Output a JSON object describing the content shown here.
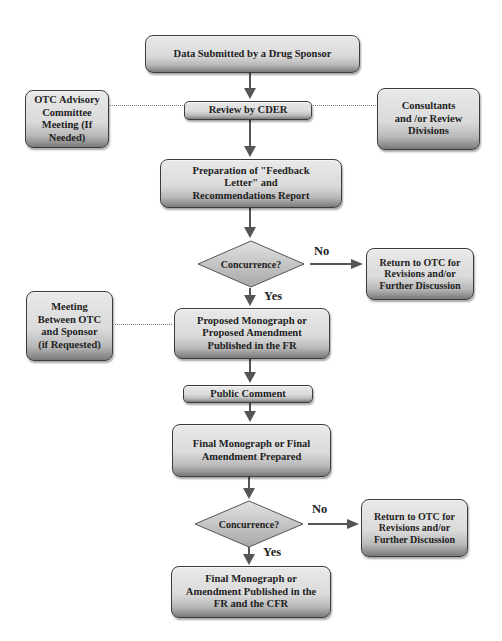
{
  "diagram": {
    "type": "flowchart",
    "nodes": {
      "data_submitted": "Data Submitted by a Drug Sponsor",
      "review_cder": "Review by CDER",
      "otc_advisory": [
        "OTC Advisory",
        "Committee",
        "Meeting (If",
        "Needed)"
      ],
      "consultants": [
        "Consultants",
        "and /or Review",
        "Divisions"
      ],
      "feedback_letter": [
        "Preparation of \"Feedback",
        "Letter\" and",
        "Recommendations Report"
      ],
      "concurrence_1": "Concurrence?",
      "return_1": [
        "Return to OTC for",
        "Revisions and/or",
        "Further Discussion"
      ],
      "meeting_sponsor": [
        "Meeting",
        "Between OTC",
        "and Sponsor",
        "(if Requested)"
      ],
      "proposed_monograph": [
        "Proposed Monograph or",
        "Proposed Amendment",
        "Published in the FR"
      ],
      "public_comment": "Public Comment",
      "final_prepared": [
        "Final Monograph or Final",
        "Amendment Prepared"
      ],
      "concurrence_2": "Concurrence?",
      "return_2": [
        "Return to OTC for",
        "Revisions and/or",
        "Further Discussion"
      ],
      "final_published": [
        "Final Monograph or",
        "Amendment Published in the",
        "FR and the CFR"
      ]
    },
    "edge_labels": {
      "no_1": "No",
      "yes_1": "Yes",
      "no_2": "No",
      "yes_2": "Yes"
    },
    "edges": [
      {
        "from": "data_submitted",
        "to": "review_cder",
        "style": "arrow"
      },
      {
        "from": "otc_advisory",
        "to": "review_cder",
        "style": "dotted"
      },
      {
        "from": "consultants",
        "to": "review_cder",
        "style": "dotted"
      },
      {
        "from": "review_cder",
        "to": "feedback_letter",
        "style": "arrow"
      },
      {
        "from": "feedback_letter",
        "to": "concurrence_1",
        "style": "arrow"
      },
      {
        "from": "concurrence_1",
        "to": "return_1",
        "style": "arrow",
        "label": "No"
      },
      {
        "from": "concurrence_1",
        "to": "proposed_monograph",
        "style": "arrow",
        "label": "Yes"
      },
      {
        "from": "meeting_sponsor",
        "to": "proposed_monograph",
        "style": "dotted"
      },
      {
        "from": "proposed_monograph",
        "to": "public_comment",
        "style": "arrow"
      },
      {
        "from": "public_comment",
        "to": "final_prepared",
        "style": "arrow"
      },
      {
        "from": "final_prepared",
        "to": "concurrence_2",
        "style": "arrow"
      },
      {
        "from": "concurrence_2",
        "to": "return_2",
        "style": "arrow",
        "label": "No"
      },
      {
        "from": "concurrence_2",
        "to": "final_published",
        "style": "arrow",
        "label": "Yes"
      }
    ],
    "colors": {
      "box_fill": "#dadada",
      "box_border": "#3c3c3c",
      "arrow": "#555555",
      "diamond_fill": "#cfcfcf",
      "text": "#1e1e1e"
    }
  }
}
